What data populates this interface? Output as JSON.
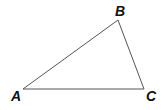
{
  "diagram": {
    "type": "triangle",
    "vertices": [
      {
        "label": "A",
        "x": 23,
        "y": 89,
        "label_x": 11,
        "label_y": 101
      },
      {
        "label": "B",
        "x": 118,
        "y": 20,
        "label_x": 115,
        "label_y": 16
      },
      {
        "label": "C",
        "x": 144,
        "y": 89,
        "label_x": 146,
        "label_y": 101
      }
    ],
    "edges": [
      {
        "from": "A",
        "to": "B"
      },
      {
        "from": "B",
        "to": "C"
      },
      {
        "from": "C",
        "to": "A"
      }
    ],
    "colors": {
      "edge": "#555555",
      "label": "#111111",
      "background": "#ffffff"
    }
  }
}
